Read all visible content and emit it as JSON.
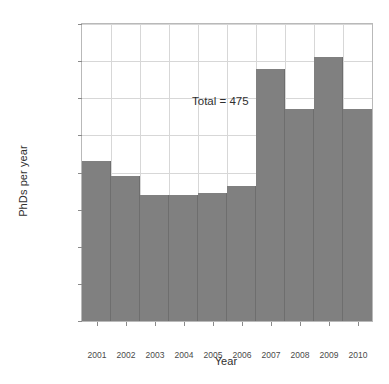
{
  "chart_data": {
    "type": "bar",
    "title": "",
    "xlabel": "Year",
    "ylabel": "PhDs per year",
    "categories": [
      "2001",
      "2002",
      "2003",
      "2004",
      "2005",
      "2006",
      "2007",
      "2008",
      "2009",
      "2010"
    ],
    "values": [
      43,
      39,
      34,
      34,
      34.5,
      36.5,
      68,
      57,
      71,
      57
    ],
    "ylim": [
      0,
      80
    ],
    "yticks": [
      0,
      10,
      20,
      30,
      40,
      50,
      60,
      70,
      80
    ],
    "ytick_labels": [
      "0",
      "10",
      "20",
      "30",
      "40",
      "50",
      "60",
      "70",
      "80"
    ],
    "grid": true,
    "legend": null,
    "bar_color": "#808080",
    "annotations": [
      {
        "text": "Total = 475",
        "x": "2002",
        "y": 64
      }
    ]
  }
}
